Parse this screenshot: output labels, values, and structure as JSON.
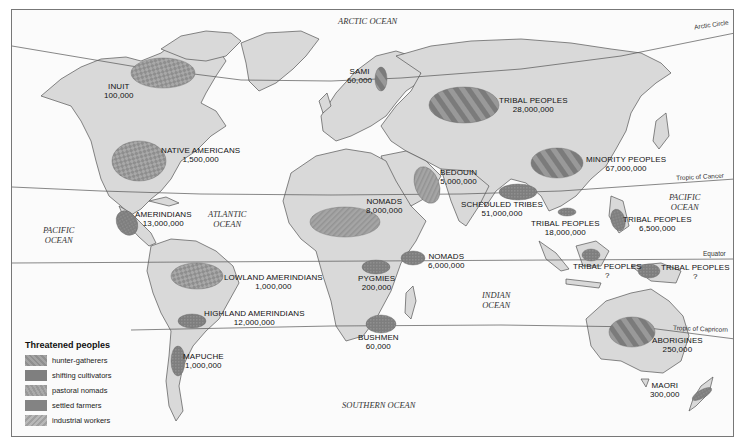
{
  "legend": {
    "title": "Threatened peoples",
    "items": [
      {
        "label": "hunter-gatherers",
        "color": "#9a9a9a",
        "pattern": "hatch-light"
      },
      {
        "label": "shifting cultivators",
        "color": "#7d7d7d",
        "pattern": "dots"
      },
      {
        "label": "pastoral nomads",
        "color": "#a3a3a3",
        "pattern": "hatch"
      },
      {
        "label": "settled farmers",
        "color": "#808080",
        "pattern": "dense"
      },
      {
        "label": "industrial workers",
        "color": "#b0b0b0",
        "pattern": "diagonal"
      }
    ]
  },
  "oceans": {
    "arctic": "ARCTIC OCEAN",
    "atlantic": [
      "ATLANTIC",
      "OCEAN"
    ],
    "pacific_west": [
      "PACIFIC",
      "OCEAN"
    ],
    "pacific_east": [
      "PACIFIC",
      "OCEAN"
    ],
    "indian": [
      "INDIAN",
      "OCEAN"
    ],
    "southern": "SOUTHERN OCEAN"
  },
  "lat_lines": {
    "arctic_circle": "Arctic Circle",
    "tropic_cancer": "Tropic of Cancer",
    "equator": "Equator",
    "tropic_capricorn": "Tropic of Capricorn"
  },
  "peoples": [
    {
      "id": "inuit",
      "name": "INUIT",
      "population": "100,000"
    },
    {
      "id": "native-americans",
      "name": "NATIVE AMERICANS",
      "population": "1,500,000"
    },
    {
      "id": "amerindians",
      "name": "AMERINDIANS",
      "population": "13,000,000"
    },
    {
      "id": "lowland-amerindians",
      "name": "LOWLAND AMERINDIANS",
      "population": "1,000,000"
    },
    {
      "id": "highland-amerindians",
      "name": "HIGHLAND AMERINDIANS",
      "population": "12,000,000"
    },
    {
      "id": "mapuche",
      "name": "MAPUCHE",
      "population": "1,000,000"
    },
    {
      "id": "sami",
      "name": "SAMI",
      "population": "60,000"
    },
    {
      "id": "tribal-peoples-russia",
      "name": "TRIBAL PEOPLES",
      "population": "28,000,000"
    },
    {
      "id": "bedouin",
      "name": "BEDOUIN",
      "population": "5,000,000"
    },
    {
      "id": "nomads-sahel",
      "name": "NOMADS",
      "population": "8,000,000"
    },
    {
      "id": "nomads-east-africa",
      "name": "NOMADS",
      "population": "6,000,000"
    },
    {
      "id": "pygmies",
      "name": "PYGMIES",
      "population": "200,000"
    },
    {
      "id": "bushmen",
      "name": "BUSHMEN",
      "population": "60,000"
    },
    {
      "id": "minority-peoples",
      "name": "MINORITY PEOPLES",
      "population": "67,000,000"
    },
    {
      "id": "scheduled-tribes",
      "name": "SCHEDULED TRIBES",
      "population": "51,000,000"
    },
    {
      "id": "tribal-peoples-se-asia",
      "name": "TRIBAL PEOPLES",
      "population": "18,000,000"
    },
    {
      "id": "tribal-peoples-philippines",
      "name": "TRIBAL PEOPLES",
      "population": "6,500,000"
    },
    {
      "id": "tribal-peoples-borneo",
      "name": "TRIBAL PEOPLES",
      "population": "?"
    },
    {
      "id": "tribal-peoples-new-guinea",
      "name": "TRIBAL PEOPLES",
      "population": "?"
    },
    {
      "id": "aborigines",
      "name": "ABORIGINES",
      "population": "250,000"
    },
    {
      "id": "maori",
      "name": "MAORI",
      "population": "300,000"
    }
  ]
}
